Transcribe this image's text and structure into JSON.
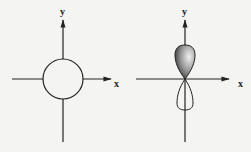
{
  "diagrams": [
    {
      "name": "s-orbital",
      "x_label": "x",
      "y_label": "y"
    },
    {
      "name": "p-orbital",
      "x_label": "x",
      "y_label": "y"
    }
  ],
  "colors": {
    "line": "#222222",
    "background": "#f4f4f2",
    "shade_dark": "#333333",
    "shade_light": "#e8e8e8"
  }
}
